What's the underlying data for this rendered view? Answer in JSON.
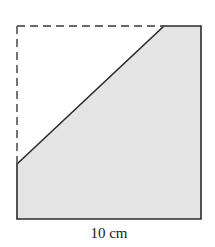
{
  "diagram": {
    "type": "geometry",
    "colors": {
      "fill": "#e4e4e4",
      "stroke": "#2b2b2b",
      "dashed_stroke": "#3a3a3a",
      "background": "#ffffff"
    },
    "square": {
      "top_left": [
        17,
        26
      ],
      "top_right": [
        201,
        26
      ],
      "bottom_right": [
        201,
        219
      ],
      "bottom_left": [
        17,
        219
      ]
    },
    "cut_points": {
      "on_top_edge": [
        164,
        26
      ],
      "on_left_edge": [
        17,
        164
      ]
    },
    "shaded_polygon": [
      [
        164,
        26
      ],
      [
        201,
        26
      ],
      [
        201,
        219
      ],
      [
        17,
        219
      ],
      [
        17,
        164
      ]
    ],
    "dashed_edges": [
      [
        [
          17,
          164
        ],
        [
          17,
          26
        ]
      ],
      [
        [
          17,
          26
        ],
        [
          164,
          26
        ]
      ]
    ],
    "labels": {
      "bottom_side": {
        "text": "10 cm",
        "x": 109,
        "y": 225
      }
    }
  }
}
